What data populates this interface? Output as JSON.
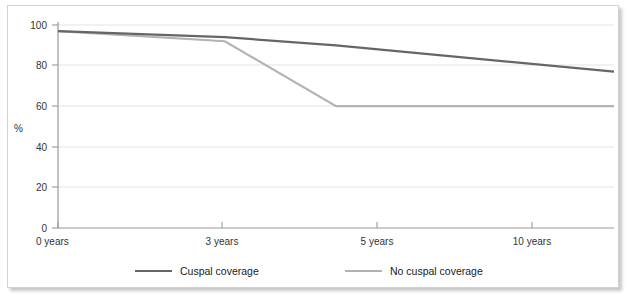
{
  "chart_data": {
    "type": "line",
    "title": "",
    "xlabel": "",
    "ylabel": "%",
    "x": [
      0,
      3,
      5,
      10
    ],
    "categories": [
      "0 years",
      "3 years",
      "5 years",
      "10 years"
    ],
    "xtick_labels": [
      "0 years",
      "3 years",
      "5 years",
      "10 years"
    ],
    "ytick_labels": [
      "0",
      "20",
      "40",
      "60",
      "80",
      "100"
    ],
    "yticks": [
      0,
      20,
      40,
      60,
      80,
      100
    ],
    "ylim": [
      0,
      100
    ],
    "xlim": [
      0,
      10
    ],
    "grid": "horizontal",
    "legend_position": "bottom",
    "series": [
      {
        "name": "Cuspal coverage",
        "color": "#666666",
        "values": [
          97,
          94,
          90,
          77
        ]
      },
      {
        "name": "No cuspal coverage",
        "color": "#b3b3b3",
        "values": [
          97,
          92,
          60,
          60
        ]
      }
    ]
  },
  "axis": {
    "y_title": "%",
    "y_ticks": [
      {
        "label": "100",
        "value": 100
      },
      {
        "label": "80",
        "value": 80
      },
      {
        "label": "60",
        "value": 60
      },
      {
        "label": "40",
        "value": 40
      },
      {
        "label": "20",
        "value": 20
      },
      {
        "label": "0",
        "value": 0
      }
    ],
    "x_ticks": [
      {
        "label": "0 years",
        "value": 0
      },
      {
        "label": "3 years",
        "value": 3
      },
      {
        "label": "5 years",
        "value": 5
      },
      {
        "label": "10 years",
        "value": 10
      }
    ]
  },
  "legend": {
    "items": [
      {
        "label": "Cuspal coverage",
        "color": "#666666"
      },
      {
        "label": "No cuspal coverage",
        "color": "#b3b3b3"
      }
    ]
  },
  "colors": {
    "series_primary": "#666666",
    "series_secondary": "#b3b3b3",
    "gridline": "#ececec",
    "axis": "#9a9a9a",
    "card_border": "#d2d2d2",
    "background": "#ffffff"
  }
}
